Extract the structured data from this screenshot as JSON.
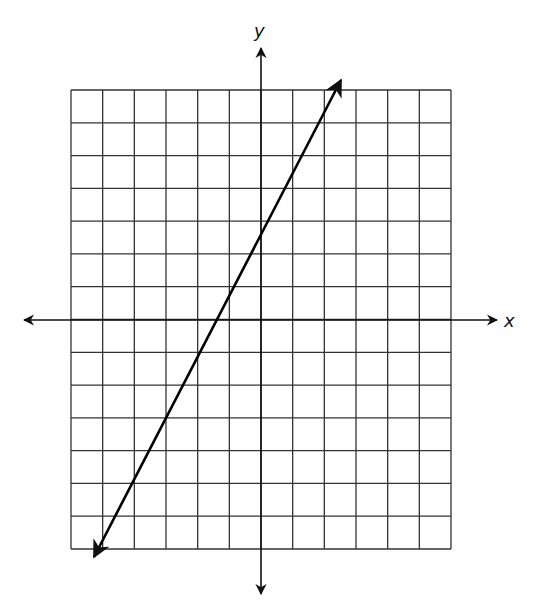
{
  "graph": {
    "type": "coordinate-plane-line",
    "axis_labels": {
      "x": "x",
      "y": "y"
    },
    "grid": {
      "columns": 12,
      "rows": 14,
      "left": 71,
      "right": 451,
      "top": 90,
      "bottom": 549
    },
    "origin_px": {
      "x": 261,
      "y": 320
    },
    "x_axis": {
      "left_tip": 24,
      "right_tip": 497
    },
    "y_axis": {
      "top_tip": 48,
      "bottom_tip": 594
    },
    "line": {
      "from_px": {
        "x": 94,
        "y": 557
      },
      "to_px": {
        "x": 341,
        "y": 80
      },
      "arrows_both_ends": true
    },
    "colors": {
      "grid": "#333333",
      "axis": "#111111",
      "line": "#000000",
      "background": "#ffffff"
    }
  }
}
